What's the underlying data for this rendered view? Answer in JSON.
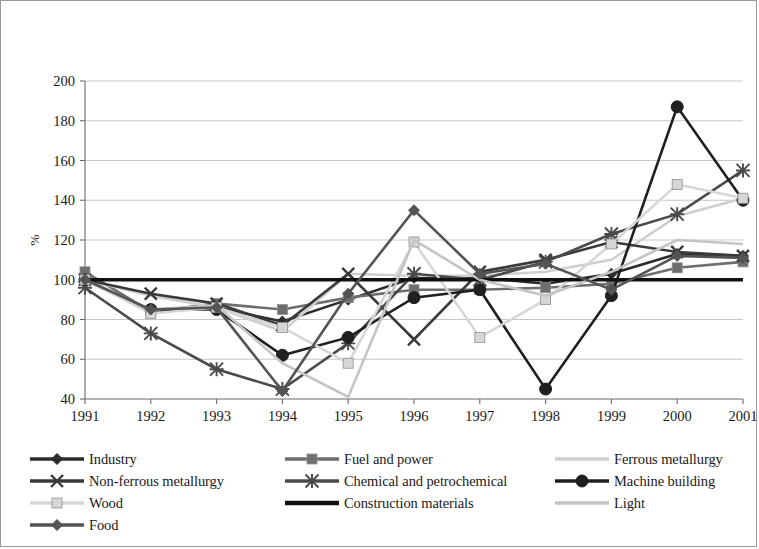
{
  "chart_data": {
    "type": "line",
    "title": "",
    "xlabel": "",
    "ylabel": "%",
    "ylim": [
      40,
      200
    ],
    "ytick_step": 20,
    "yticks": [
      40,
      60,
      80,
      100,
      120,
      140,
      160,
      180,
      200
    ],
    "grid": true,
    "legend_position": "bottom",
    "categories": [
      "1991",
      "1992",
      "1993",
      "1994",
      "1995",
      "1996",
      "1997",
      "1998",
      "1999",
      "2000",
      "2001"
    ],
    "series": [
      {
        "name": "Industry",
        "marker": "diamond",
        "color": "#2b2b2b",
        "values": [
          100,
          84,
          86,
          79,
          90,
          101,
          101,
          98,
          103,
          113,
          112
        ]
      },
      {
        "name": "Fuel and power",
        "marker": "square",
        "color": "#6e6e6e",
        "values": [
          104,
          84,
          88,
          85,
          91,
          95,
          95,
          96,
          98,
          106,
          109
        ]
      },
      {
        "name": "Ferrous metallurgy",
        "marker": "none",
        "color": "#cfcfcf",
        "values": [
          100,
          92,
          86,
          74,
          103,
          102,
          102,
          104,
          110,
          132,
          141
        ]
      },
      {
        "name": "Non-ferrous metallurgy",
        "marker": "x",
        "color": "#3a3a3a",
        "values": [
          100,
          93,
          88,
          77,
          103,
          70,
          104,
          110,
          119,
          114,
          112
        ]
      },
      {
        "name": "Chemical and petrochemical",
        "marker": "asterisk",
        "color": "#4a4a4a",
        "values": [
          96,
          73,
          55,
          45,
          68,
          103,
          100,
          109,
          123,
          133,
          155
        ]
      },
      {
        "name": "Machine building",
        "marker": "circle",
        "color": "#1f1f1f",
        "values": [
          100,
          85,
          85,
          62,
          71,
          91,
          95,
          45,
          92,
          187,
          140
        ]
      },
      {
        "name": "Wood",
        "marker": "square",
        "color": "#d6d6d6",
        "values": [
          100,
          83,
          86,
          76,
          58,
          119,
          71,
          90,
          118,
          148,
          141
        ]
      },
      {
        "name": "Construction materials",
        "marker": "none",
        "color": "#111111",
        "values": [
          100,
          100,
          100,
          100,
          100,
          100,
          100,
          100,
          100,
          100,
          100
        ]
      },
      {
        "name": "Light",
        "marker": "none",
        "color": "#c4c4c4",
        "values": [
          100,
          85,
          87,
          58,
          41,
          120,
          100,
          92,
          104,
          120,
          118
        ]
      },
      {
        "name": "Food",
        "marker": "diamond",
        "color": "#545454",
        "values": [
          100,
          85,
          86,
          44,
          93,
          135,
          103,
          108,
          95,
          112,
          111
        ]
      }
    ]
  },
  "legend": {
    "columns": [
      [
        {
          "label": "Industry",
          "series": 0
        },
        {
          "label": "Non-ferrous metallurgy",
          "series": 3
        },
        {
          "label": "Wood",
          "series": 6
        },
        {
          "label": "Food",
          "series": 9
        }
      ],
      [
        {
          "label": "Fuel and power",
          "series": 1
        },
        {
          "label": "Chemical and petrochemical",
          "series": 4
        },
        {
          "label": "Construction materials",
          "series": 7
        }
      ],
      [
        {
          "label": "Ferrous metallurgy",
          "series": 2
        },
        {
          "label": "Machine building",
          "series": 5
        },
        {
          "label": "Light",
          "series": 8
        }
      ]
    ]
  }
}
